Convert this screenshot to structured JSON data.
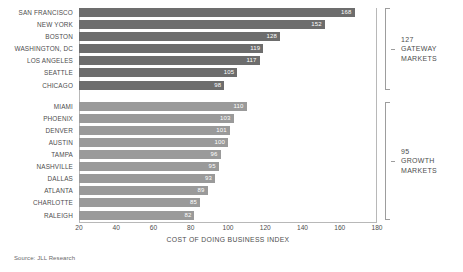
{
  "chart_data": {
    "type": "bar",
    "orientation": "horizontal",
    "title": "",
    "xlabel": "COST OF DOING BUSINESS INDEX",
    "ylabel": "",
    "xlim": [
      20,
      180
    ],
    "xticks": [
      20,
      40,
      60,
      80,
      100,
      120,
      140,
      160,
      180
    ],
    "grid": false,
    "legend": "none",
    "groups": [
      {
        "name": "GATEWAY MARKETS",
        "average": 127,
        "annotation_value": "127",
        "annotation_line1": "GATEWAY",
        "annotation_line2": "MARKETS",
        "bar_color": "#6d6d6d",
        "categories": [
          "SAN FRANCISCO",
          "NEW YORK",
          "BOSTON",
          "WASHINGTON, DC",
          "LOS ANGELES",
          "SEATTLE",
          "CHICAGO"
        ],
        "values": [
          168,
          152,
          128,
          119,
          117,
          105,
          98
        ]
      },
      {
        "name": "GROWTH MARKETS",
        "average": 95,
        "annotation_value": "95",
        "annotation_line1": "GROWTH",
        "annotation_line2": "MARKETS",
        "bar_color": "#9a9a9a",
        "categories": [
          "MIAMI",
          "PHOENIX",
          "DENVER",
          "AUSTIN",
          "TAMPA",
          "NASHVILLE",
          "DALLAS",
          "ATLANTA",
          "CHARLOTTE",
          "RALEIGH"
        ],
        "values": [
          110,
          103,
          101,
          100,
          96,
          95,
          93,
          89,
          85,
          82
        ]
      }
    ]
  },
  "source_note": "Source: JLL Research"
}
